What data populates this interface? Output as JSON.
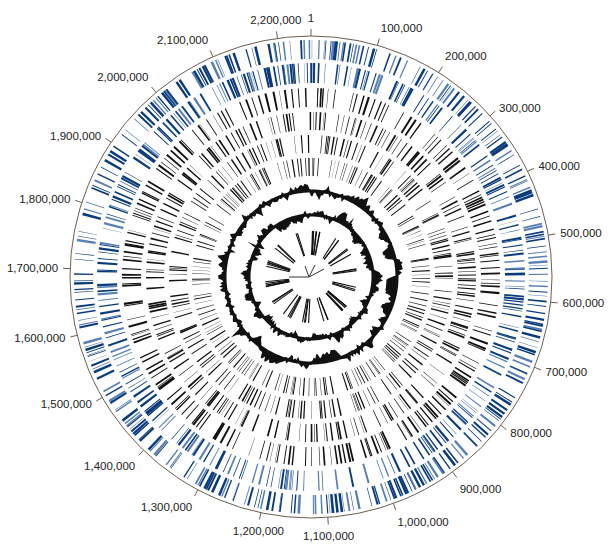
{
  "figure": {
    "type": "circular-genome-map",
    "genome_length": 2250000,
    "center": [
      311,
      277
    ],
    "outer_radius": 241,
    "tick_interval": 100000,
    "colors": {
      "blue": "#0b3b7c",
      "light_blue": "#5a7fb5",
      "black": "#111111",
      "axis": "#6b5e50",
      "label": "#222222"
    }
  },
  "scale_labels": [
    {
      "pos": 0,
      "text": "1"
    },
    {
      "pos": 100000,
      "text": "100,000"
    },
    {
      "pos": 200000,
      "text": "200,000"
    },
    {
      "pos": 300000,
      "text": "300,000"
    },
    {
      "pos": 400000,
      "text": "400,000"
    },
    {
      "pos": 500000,
      "text": "500,000"
    },
    {
      "pos": 600000,
      "text": "600,000"
    },
    {
      "pos": 700000,
      "text": "700,000"
    },
    {
      "pos": 800000,
      "text": "800,000"
    },
    {
      "pos": 900000,
      "text": "900,000"
    },
    {
      "pos": 1000000,
      "text": "1,000,000"
    },
    {
      "pos": 1100000,
      "text": "1,100,000"
    },
    {
      "pos": 1200000,
      "text": "1,200,000"
    },
    {
      "pos": 1300000,
      "text": "1,300,000"
    },
    {
      "pos": 1400000,
      "text": "1,400,000"
    },
    {
      "pos": 1500000,
      "text": "1,500,000"
    },
    {
      "pos": 1600000,
      "text": "1,600,000"
    },
    {
      "pos": 1700000,
      "text": "1,700,000"
    },
    {
      "pos": 1800000,
      "text": "1,800,000"
    },
    {
      "pos": 1900000,
      "text": "1,900,000"
    },
    {
      "pos": 2000000,
      "text": "2,000,000"
    },
    {
      "pos": 2100000,
      "text": "2,100,000"
    },
    {
      "pos": 2200000,
      "text": "2,200,000"
    }
  ],
  "rings": [
    {
      "name": "cds-forward-strand",
      "r_in": 218,
      "r_out": 237,
      "color": "blue",
      "count": 330,
      "seed": 11
    },
    {
      "name": "cds-reverse-strand",
      "r_in": 194,
      "r_out": 214,
      "color": "blue",
      "count": 310,
      "seed": 23
    },
    {
      "name": "feature-ring-3",
      "r_in": 170,
      "r_out": 189,
      "color": "black",
      "count": 240,
      "seed": 37
    },
    {
      "name": "feature-ring-4",
      "r_in": 147,
      "r_out": 165,
      "color": "black",
      "count": 220,
      "seed": 41
    },
    {
      "name": "feature-ring-5",
      "r_in": 124,
      "r_out": 142,
      "color": "black",
      "count": 210,
      "seed": 53
    },
    {
      "name": "feature-ring-6",
      "r_in": 101,
      "r_out": 119,
      "color": "black",
      "count": 190,
      "seed": 67
    }
  ],
  "plots": [
    {
      "name": "gc-content-plot",
      "baseline_r": 86,
      "amplitude": 9,
      "seed": 71
    },
    {
      "name": "gc-skew-plot",
      "baseline_r": 62,
      "amplitude": 7,
      "seed": 83
    }
  ],
  "inner_ring": {
    "name": "rna-genes-ring",
    "r_in": 22,
    "r_out": 46,
    "count": 56,
    "seed": 97
  }
}
